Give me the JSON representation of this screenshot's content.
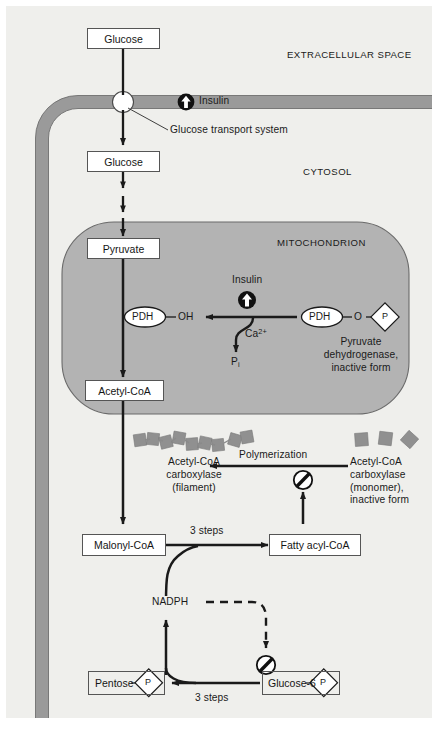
{
  "figure": {
    "background_color": "#efefec",
    "membrane_color": "#9a9a9a",
    "mitochondrion_color": "#b3b3b3",
    "protein_block_color": "#909090",
    "stroke_color": "#1a1a1a"
  },
  "compartments": {
    "extracellular": "EXTRACELLULAR SPACE",
    "cytosol": "CYTOSOL",
    "mitochondrion": "MITOCHONDRION"
  },
  "membrane": {
    "insulin_label": "Insulin",
    "insulin_icon": "insulin-up-arrow-icon",
    "transporter_label": "Glucose transport system",
    "transporter_icon": "glucose-transporter-pore-icon"
  },
  "metabolites": {
    "glucose_out": "Glucose",
    "glucose_in": "Glucose",
    "pyruvate": "Pyruvate",
    "acetyl_coa": "Acetyl-CoA",
    "malonyl_coa": "Malonyl-CoA",
    "fatty_acyl_coa": "Fatty acyl-CoA",
    "pentose": "Pentose",
    "glucose_6": "Glucose-6",
    "nadph": "NADPH",
    "phosphate_group": "P"
  },
  "mitochondrial_reaction": {
    "insulin_label": "Insulin",
    "insulin_icon": "insulin-up-arrow-icon",
    "pdh_active": "PDH",
    "pdh_active_group": "OH",
    "pdh_inactive": "PDH",
    "pdh_inactive_group": "O",
    "pdh_inactive_phosphate": "P",
    "calcium": "Ca",
    "calcium_charge": "2+",
    "inorganic_phosphate": "P",
    "inorganic_phosphate_sub": "i",
    "inactive_enzyme_caption": [
      "Pyruvate",
      "dehydrogenase,",
      "inactive form"
    ]
  },
  "carboxylase": {
    "filament_caption": [
      "Acetyl-CoA",
      "carboxylase",
      "(filament)"
    ],
    "monomer_caption": [
      "Acetyl-CoA",
      "carboxylase",
      "(monomer),",
      "inactive form"
    ],
    "polymerization_label": "Polymerization",
    "filament_icon": "carboxylase-filament-icon",
    "monomer_icon": "carboxylase-monomer-icon"
  },
  "steps": {
    "malonyl_to_fatty": "3 steps",
    "glucose6_to_pentose": "3 steps"
  },
  "inhibition": {
    "icon": "inhibition-no-sign-icon",
    "targets": [
      "acetyl-coa-carboxylase-monomer",
      "glucose-6-phosphate-pathway"
    ]
  }
}
